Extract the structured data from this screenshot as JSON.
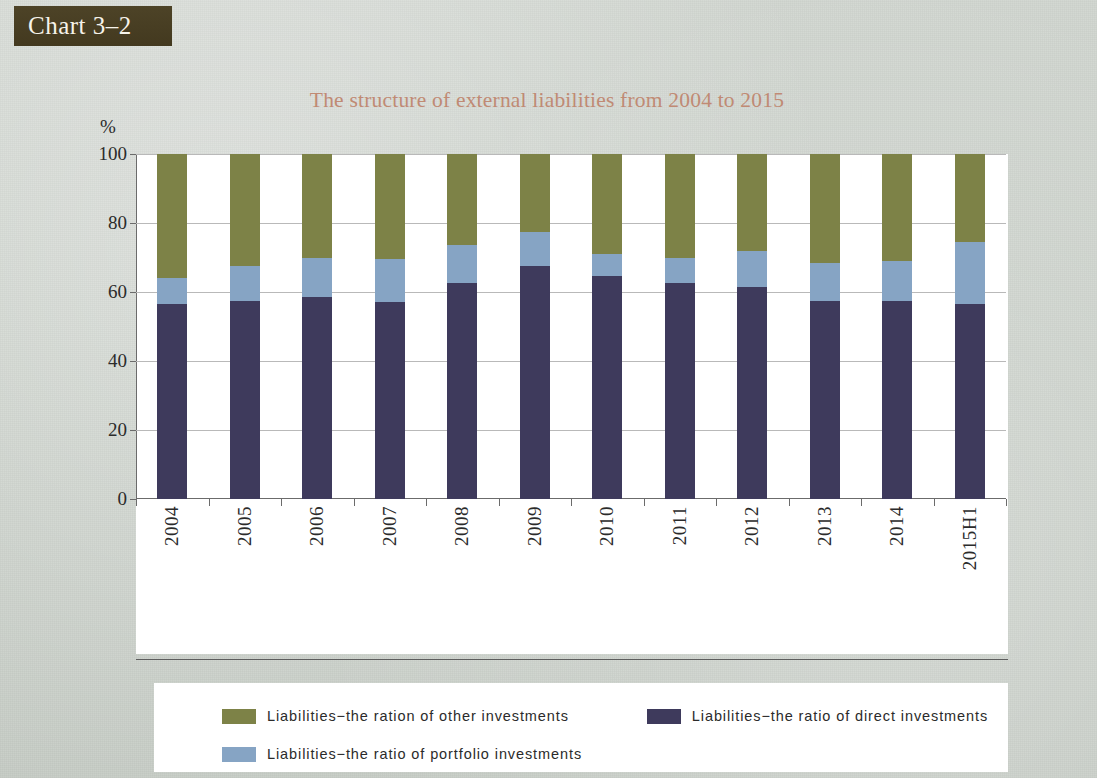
{
  "badge": {
    "label": "Chart 3–2"
  },
  "chart_title": "The structure of external liabilities from 2004 to 2015",
  "axis": {
    "y_unit": "%",
    "y_ticks": [
      "0",
      "20",
      "40",
      "60",
      "80",
      "100"
    ]
  },
  "legend": {
    "items": [
      {
        "label": "Liabilities−the ration of other investments",
        "color": "#7d8247"
      },
      {
        "label": "Liabilities−the ratio of direct investments",
        "color": "#3e3a5c"
      },
      {
        "label": "Liabilities−the ratio of portfolio investments",
        "color": "#86a4c4"
      }
    ]
  },
  "colors": {
    "other_investments": "#7d8247",
    "direct_investments": "#3e3a5c",
    "portfolio_investments": "#86a4c4",
    "title": "#c08a74",
    "badge_bg": "#473d23",
    "page_bg": "#cbd1ca",
    "plot_bg": "#ffffff"
  },
  "chart_data": {
    "type": "bar",
    "stacked": true,
    "title": "The structure of external liabilities from 2004 to 2015",
    "xlabel": "",
    "ylabel": "%",
    "ylim": [
      0,
      100
    ],
    "yticks": [
      0,
      20,
      40,
      60,
      80,
      100
    ],
    "grid": true,
    "legend_position": "bottom",
    "categories": [
      "2004",
      "2005",
      "2006",
      "2007",
      "2008",
      "2009",
      "2010",
      "2011",
      "2012",
      "2013",
      "2014",
      "2015H1"
    ],
    "series": [
      {
        "name": "Liabilities−the ratio of direct investments",
        "color": "#3e3a5c",
        "values": [
          56.5,
          57.5,
          58.5,
          57.0,
          62.5,
          67.5,
          64.5,
          62.5,
          61.5,
          57.5,
          57.5,
          56.5
        ]
      },
      {
        "name": "Liabilities−the ratio of portfolio investments",
        "color": "#86a4c4",
        "values": [
          7.5,
          10.0,
          11.5,
          12.5,
          11.0,
          10.0,
          6.5,
          7.5,
          10.5,
          11.0,
          11.5,
          18.0
        ]
      },
      {
        "name": "Liabilities−the ration of other investments",
        "color": "#7d8247",
        "values": [
          36.0,
          32.5,
          30.0,
          30.5,
          26.5,
          22.5,
          29.0,
          30.0,
          28.0,
          31.5,
          31.0,
          25.5
        ]
      }
    ],
    "cumulative_tops": {
      "direct": [
        56.5,
        57.5,
        58.5,
        57.0,
        62.5,
        67.5,
        64.5,
        62.5,
        61.5,
        57.5,
        57.5,
        56.5
      ],
      "direct_plus_portfolio": [
        64.0,
        67.5,
        70.0,
        69.5,
        73.5,
        77.5,
        71.0,
        70.0,
        72.0,
        68.5,
        69.0,
        74.5
      ],
      "total": [
        100,
        100,
        100,
        100,
        100,
        100,
        100,
        100,
        100,
        100,
        100,
        100
      ]
    }
  }
}
